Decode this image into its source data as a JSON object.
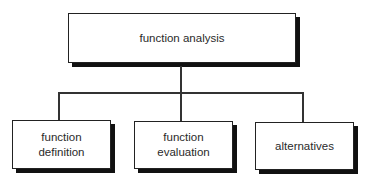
{
  "diagram": {
    "type": "hierarchy",
    "root": {
      "label": "function analysis"
    },
    "children": [
      {
        "line1": "function",
        "line2": "definition"
      },
      {
        "line1": "function",
        "line2": "evaluation"
      },
      {
        "line1": "alternatives",
        "line2": ""
      }
    ]
  }
}
